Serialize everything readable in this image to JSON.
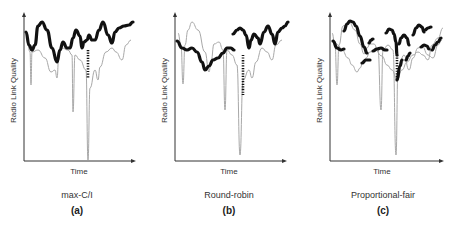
{
  "figure": {
    "panels": [
      {
        "id": "a",
        "scheduler": "max-C/I",
        "letter": "(a)",
        "y_axis_label": "Radio Link Quality",
        "x_axis_label": "Time"
      },
      {
        "id": "b",
        "scheduler": "Round-robin",
        "letter": "(b)",
        "y_axis_label": "Radio Link Quality",
        "x_axis_label": "Time"
      },
      {
        "id": "c",
        "scheduler": "Proportional-fair",
        "letter": "(c)",
        "y_axis_label": "Radio Link Quality",
        "x_axis_label": "Time"
      }
    ],
    "legend_semantics": {
      "thin_gray_line": "channel quality of individual user",
      "thick_black_line": "user scheduled"
    },
    "colors": {
      "axis": "#333333",
      "channel_curve": "#a8a8a8",
      "scheduled_curve": "#111111"
    }
  }
}
